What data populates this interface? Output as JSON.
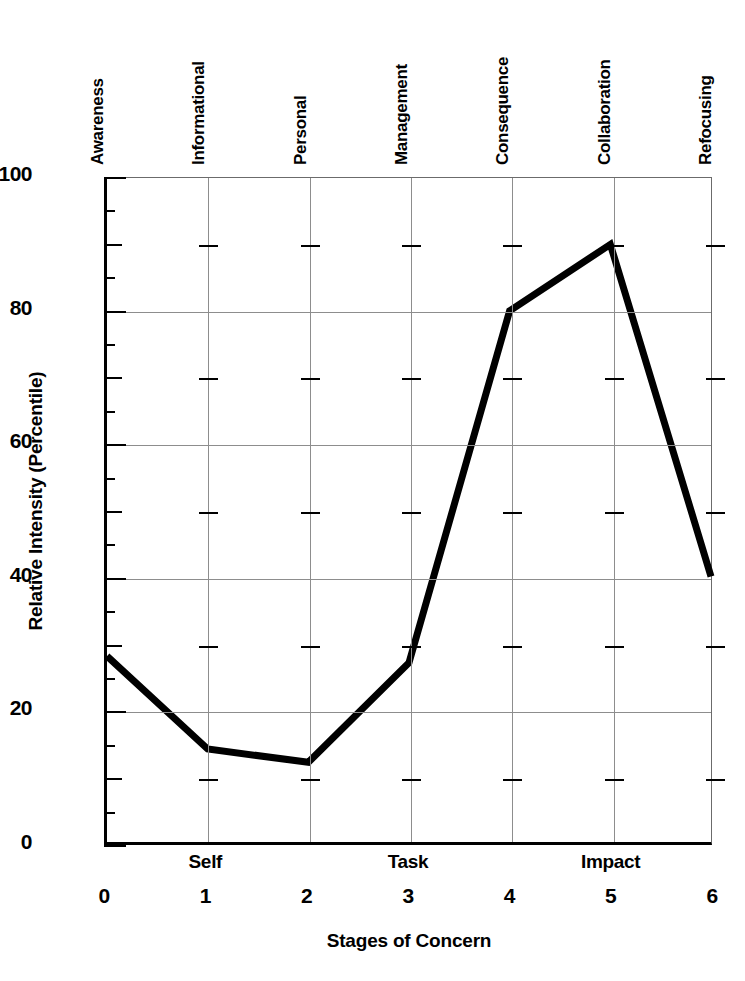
{
  "chart_data": {
    "type": "line",
    "title": "",
    "xlabel": "Stages of Concern",
    "ylabel": "Relative Intensity (Percentile)",
    "x": [
      0,
      1,
      2,
      3,
      4,
      5,
      6
    ],
    "values": [
      28,
      14,
      12,
      27,
      80,
      90,
      40
    ],
    "categories": [
      "Awareness",
      "Informational",
      "Personal",
      "Management",
      "Consequence",
      "Collaboration",
      "Refocusing"
    ],
    "xlim": [
      0,
      6
    ],
    "ylim": [
      0,
      100
    ],
    "xtick_labels": [
      "0",
      "1",
      "2",
      "3",
      "4",
      "5",
      "6"
    ],
    "ytick_labels": [
      "0",
      "20",
      "40",
      "60",
      "80",
      "100"
    ],
    "ytick_values": [
      0,
      20,
      40,
      60,
      80,
      100
    ],
    "y_minor_step": 5,
    "y_medium_step": 10,
    "grid": true,
    "legend": "none",
    "line_color": "#000000",
    "grid_color": "#8d8d8d",
    "axis_color": "#000000",
    "group_labels": [
      {
        "text": "Self",
        "x": 1
      },
      {
        "text": "Task",
        "x": 3
      },
      {
        "text": "Impact",
        "x": 5
      }
    ]
  },
  "axes": {
    "y_title": "Relative Intensity (Percentile)",
    "x_title": "Stages of Concern"
  },
  "stage_labels": [
    "Awareness",
    "Informational",
    "Personal",
    "Management",
    "Consequence",
    "Collaboration",
    "Refocusing"
  ],
  "ytick_labels": [
    "100",
    "80",
    "60",
    "40",
    "20",
    "0"
  ],
  "xtick_labels": [
    "0",
    "1",
    "2",
    "3",
    "4",
    "5",
    "6"
  ],
  "group_labels": [
    "Self",
    "Task",
    "Impact"
  ]
}
